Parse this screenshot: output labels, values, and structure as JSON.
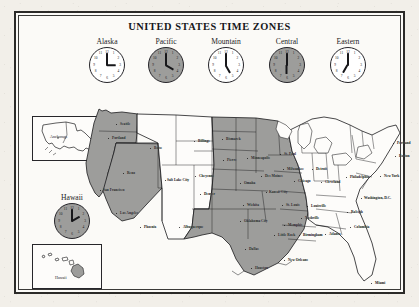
{
  "page": {
    "title": "UNITED STATES TIME ZONES",
    "background_color": "#f2efe9",
    "paper_color": "#fbfaf7",
    "frame_color": "#2b2a28",
    "shade_color": "#9d9d9b"
  },
  "clocks": [
    {
      "label": "Alaska",
      "hour": 3,
      "minute": 0,
      "shaded": false,
      "time_text": "3:00"
    },
    {
      "label": "Pacific",
      "hour": 4,
      "minute": 0,
      "shaded": true,
      "time_text": "4:00"
    },
    {
      "label": "Mountain",
      "hour": 5,
      "minute": 0,
      "shaded": false,
      "time_text": "5:00"
    },
    {
      "label": "Central",
      "hour": 6,
      "minute": 0,
      "shaded": true,
      "time_text": "6:00"
    },
    {
      "label": "Eastern",
      "hour": 7,
      "minute": 0,
      "shaded": false,
      "time_text": "7:00"
    }
  ],
  "hawaii": {
    "label": "Hawaii",
    "clock": {
      "hour": 2,
      "minute": 0,
      "shaded": true,
      "time_text": "2:00"
    },
    "inset_city": "Hawaii"
  },
  "alaska_inset": {
    "city": "Anchorage"
  },
  "clock_numerals": [
    "12",
    "1",
    "2",
    "3",
    "4",
    "5",
    "6",
    "7",
    "8",
    "9",
    "10",
    "11"
  ],
  "cities": [
    {
      "name": "Seattle",
      "x": 100,
      "y": 111,
      "dx": 4,
      "dy": 1
    },
    {
      "name": "Portland",
      "x": 92,
      "y": 125,
      "dx": 4,
      "dy": 1
    },
    {
      "name": "Boise",
      "x": 134,
      "y": 135,
      "dx": 4,
      "dy": 1
    },
    {
      "name": "Reno",
      "x": 107,
      "y": 160,
      "dx": 4,
      "dy": 1
    },
    {
      "name": "San Francisco",
      "x": 84,
      "y": 177,
      "dx": 3,
      "dy": 1
    },
    {
      "name": "Los Angeles",
      "x": 100,
      "y": 200,
      "dx": 4,
      "dy": 1
    },
    {
      "name": "Salt Lake City",
      "x": 149,
      "y": 167,
      "dx": 2,
      "dy": 1
    },
    {
      "name": "Phoenix",
      "x": 124,
      "y": 214,
      "dx": 4,
      "dy": 1
    },
    {
      "name": "Albuquerque",
      "x": 163,
      "y": 214,
      "dx": 4,
      "dy": 1
    },
    {
      "name": "Billings",
      "x": 178,
      "y": 128,
      "dx": 4,
      "dy": 1
    },
    {
      "name": "Cheyenne",
      "x": 179,
      "y": 163,
      "dx": 4,
      "dy": 1
    },
    {
      "name": "Denver",
      "x": 184,
      "y": 181,
      "dx": 4,
      "dy": 1
    },
    {
      "name": "Bismarck",
      "x": 206,
      "y": 126,
      "dx": 4,
      "dy": 1
    },
    {
      "name": "Pierre",
      "x": 207,
      "y": 147,
      "dx": 4,
      "dy": 1
    },
    {
      "name": "Minneapolis",
      "x": 231,
      "y": 145,
      "dx": 4,
      "dy": 1
    },
    {
      "name": "St. Paul",
      "x": 264,
      "y": 141,
      "dx": 4,
      "dy": 1
    },
    {
      "name": "Milwaukee",
      "x": 267,
      "y": 156,
      "dx": 4,
      "dy": 1
    },
    {
      "name": "Des Moines",
      "x": 245,
      "y": 163,
      "dx": 4,
      "dy": 1
    },
    {
      "name": "Omaha",
      "x": 224,
      "y": 170,
      "dx": 4,
      "dy": 1
    },
    {
      "name": "Kansas City",
      "x": 250,
      "y": 179,
      "dx": 3,
      "dy": 1
    },
    {
      "name": "Wichita",
      "x": 227,
      "y": 192,
      "dx": 4,
      "dy": 1
    },
    {
      "name": "St. Louis",
      "x": 266,
      "y": 192,
      "dx": 4,
      "dy": 1
    },
    {
      "name": "Chicago",
      "x": 278,
      "y": 168,
      "dx": 4,
      "dy": 1
    },
    {
      "name": "Detroit",
      "x": 296,
      "y": 156,
      "dx": 4,
      "dy": 1
    },
    {
      "name": "Cleveland",
      "x": 305,
      "y": 169,
      "dx": 4,
      "dy": 1
    },
    {
      "name": "Philadelphia",
      "x": 330,
      "y": 164,
      "dx": 4,
      "dy": 1
    },
    {
      "name": "New York",
      "x": 364,
      "y": 163,
      "dx": 4,
      "dy": 1
    },
    {
      "name": "Boston",
      "x": 379,
      "y": 143,
      "dx": 4,
      "dy": 1
    },
    {
      "name": "Portland ",
      "x": 377,
      "y": 130,
      "dx": 4,
      "dy": 1
    },
    {
      "name": "Washington, D.C.",
      "x": 345,
      "y": 185,
      "dx": 3,
      "dy": 1
    },
    {
      "name": "Louisville",
      "x": 291,
      "y": 193,
      "dx": 4,
      "dy": 1
    },
    {
      "name": "Nashville",
      "x": 285,
      "y": 205,
      "dx": 4,
      "dy": 1
    },
    {
      "name": "Raleigh",
      "x": 331,
      "y": 199,
      "dx": 4,
      "dy": 1
    },
    {
      "name": "Columbia",
      "x": 334,
      "y": 214,
      "dx": 4,
      "dy": 1
    },
    {
      "name": "Atlanta",
      "x": 309,
      "y": 221,
      "dx": 4,
      "dy": 1
    },
    {
      "name": "Birmingham",
      "x": 283,
      "y": 222,
      "dx": 4,
      "dy": 1
    },
    {
      "name": "Oklahoma City",
      "x": 224,
      "y": 208,
      "dx": 4,
      "dy": 1
    },
    {
      "name": "Little Rock",
      "x": 258,
      "y": 222,
      "dx": 4,
      "dy": 1
    },
    {
      "name": "Memphis",
      "x": 268,
      "y": 212,
      "dx": 4,
      "dy": 1
    },
    {
      "name": "Dallas",
      "x": 229,
      "y": 236,
      "dx": 4,
      "dy": 1
    },
    {
      "name": "Houston",
      "x": 235,
      "y": 255,
      "dx": 4,
      "dy": 1
    },
    {
      "name": "New Orleans",
      "x": 268,
      "y": 247,
      "dx": 4,
      "dy": 1
    },
    {
      "name": "Miami",
      "x": 355,
      "y": 270,
      "dx": 4,
      "dy": 1
    }
  ]
}
